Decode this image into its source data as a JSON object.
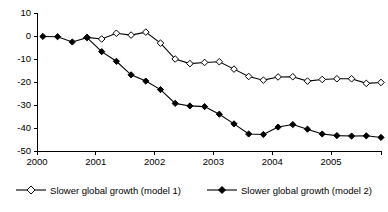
{
  "chart_data": {
    "type": "line",
    "title": "",
    "xlabel": "",
    "ylabel": "",
    "xlim": [
      2000.0,
      2005.85
    ],
    "ylim": [
      -50,
      10
    ],
    "ytick_labels": [
      "10",
      "0",
      "-10",
      "-20",
      "-30",
      "-40",
      "-50"
    ],
    "ytick_values": [
      10,
      0,
      -10,
      -20,
      -30,
      -40,
      -50
    ],
    "xtick_labels": [
      "2000",
      "2001",
      "2002",
      "2003",
      "2004",
      "2005"
    ],
    "xtick_values": [
      2000,
      2001,
      2002,
      2003,
      2004,
      2005
    ],
    "grid": false,
    "legend_position": "bottom",
    "series": [
      {
        "name": "Slower global growth (model 1)",
        "marker": "open-diamond",
        "color": "#000000",
        "x": [
          2000.85,
          2001.1,
          2001.35,
          2001.6,
          2001.85,
          2002.1,
          2002.35,
          2002.6,
          2002.85,
          2003.1,
          2003.35,
          2003.6,
          2003.85,
          2004.1,
          2004.35,
          2004.6,
          2004.85,
          2005.1,
          2005.35,
          2005.6,
          2005.85
        ],
        "values": [
          -0.6,
          -1.3,
          1.2,
          0.4,
          1.7,
          -3.1,
          -10.0,
          -12.0,
          -11.5,
          -11.2,
          -14.4,
          -17.6,
          -19.2,
          -17.8,
          -17.7,
          -19.6,
          -18.9,
          -18.6,
          -18.6,
          -20.6,
          -20.2
        ]
      },
      {
        "name": "Slower global growth (model 2)",
        "marker": "filled-diamond",
        "color": "#000000",
        "x": [
          2000.1,
          2000.35,
          2000.6,
          2000.85,
          2001.1,
          2001.35,
          2001.6,
          2001.85,
          2002.1,
          2002.35,
          2002.6,
          2002.85,
          2003.1,
          2003.35,
          2003.6,
          2003.85,
          2004.1,
          2004.35,
          2004.6,
          2004.85,
          2005.1,
          2005.35,
          2005.6,
          2005.85
        ],
        "values": [
          -0.2,
          -0.3,
          -2.6,
          -0.7,
          -6.8,
          -11.0,
          -16.9,
          -19.6,
          -23.3,
          -29.3,
          -30.4,
          -30.7,
          -34.0,
          -38.2,
          -42.6,
          -42.8,
          -39.6,
          -38.5,
          -40.5,
          -42.6,
          -43.3,
          -43.5,
          -43.4,
          -44.1
        ]
      }
    ]
  },
  "legend": {
    "entries": [
      {
        "label": "Slower global growth (model 1)",
        "marker": "open-diamond"
      },
      {
        "label": "Slower global growth (model 2)",
        "marker": "filled-diamond"
      }
    ]
  }
}
